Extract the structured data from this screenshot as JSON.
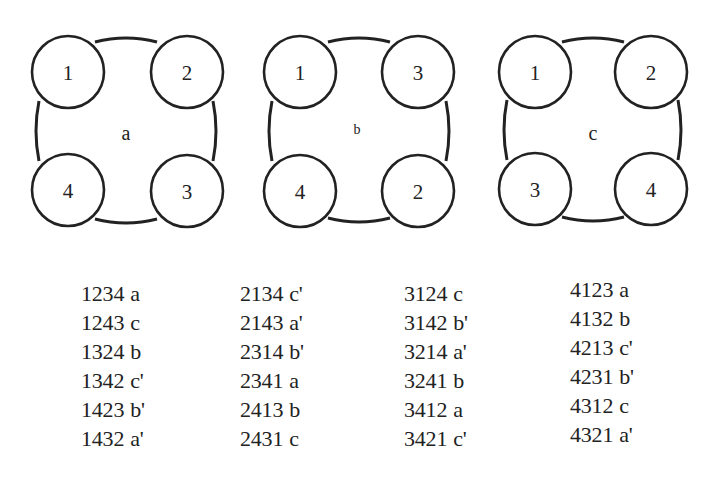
{
  "colors": {
    "stroke": "#222222",
    "background": "#ffffff",
    "text": "#222222"
  },
  "diagrams": [
    {
      "label": "a",
      "center": [
        126,
        130
      ],
      "circles": [
        {
          "pos": "top-left",
          "number": "1"
        },
        {
          "pos": "top-right",
          "number": "2"
        },
        {
          "pos": "bottom-left",
          "number": "4"
        },
        {
          "pos": "bottom-right",
          "number": "3"
        }
      ]
    },
    {
      "label": "b",
      "center": [
        359,
        130
      ],
      "circles": [
        {
          "pos": "top-left",
          "number": "1"
        },
        {
          "pos": "top-right",
          "number": "3"
        },
        {
          "pos": "bottom-left",
          "number": "4"
        },
        {
          "pos": "bottom-right",
          "number": "2"
        }
      ]
    },
    {
      "label": "c",
      "center": [
        593,
        130
      ],
      "circles": [
        {
          "pos": "top-left",
          "number": "1"
        },
        {
          "pos": "top-right",
          "number": "2"
        },
        {
          "pos": "bottom-left",
          "number": "3"
        },
        {
          "pos": "bottom-right",
          "number": "4"
        }
      ]
    }
  ],
  "permutation_table": {
    "columns": [
      {
        "rows": [
          {
            "perm": "1234",
            "type": "a"
          },
          {
            "perm": "1243",
            "type": "c"
          },
          {
            "perm": "1324",
            "type": "b"
          },
          {
            "perm": "1342",
            "type": "c'"
          },
          {
            "perm": "1423",
            "type": "b'"
          },
          {
            "perm": "1432",
            "type": "a'"
          }
        ]
      },
      {
        "rows": [
          {
            "perm": "2134",
            "type": "c'"
          },
          {
            "perm": "2143",
            "type": "a'"
          },
          {
            "perm": "2314",
            "type": "b'"
          },
          {
            "perm": "2341",
            "type": "a"
          },
          {
            "perm": "2413",
            "type": "b"
          },
          {
            "perm": "2431",
            "type": "c"
          }
        ]
      },
      {
        "rows": [
          {
            "perm": "3124",
            "type": "c"
          },
          {
            "perm": "3142",
            "type": "b'"
          },
          {
            "perm": "3214",
            "type": "a'"
          },
          {
            "perm": "3241",
            "type": "b"
          },
          {
            "perm": "3412",
            "type": "a"
          },
          {
            "perm": "3421",
            "type": "c'"
          }
        ]
      },
      {
        "rows": [
          {
            "perm": "4123",
            "type": "a"
          },
          {
            "perm": "4132",
            "type": "b"
          },
          {
            "perm": "4213",
            "type": "c'"
          },
          {
            "perm": "4231",
            "type": "b'"
          },
          {
            "perm": "4312",
            "type": "c"
          },
          {
            "perm": "4321",
            "type": "a'"
          }
        ]
      }
    ]
  }
}
